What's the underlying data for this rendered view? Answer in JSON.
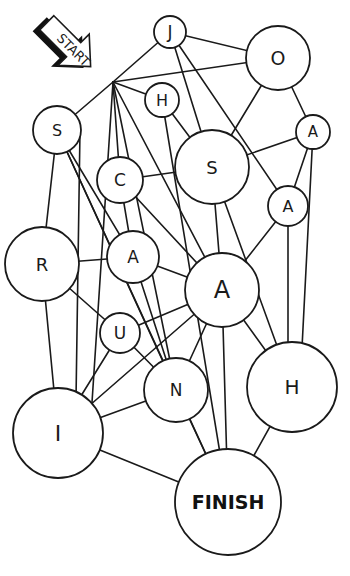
{
  "diagram": {
    "type": "letter-maze-graph",
    "start": {
      "label": "START",
      "hub": [
        113,
        82
      ]
    },
    "finish": {
      "id": "finish",
      "label": "FINISH",
      "cx": 228,
      "cy": 502,
      "r": 53
    },
    "nodes": [
      {
        "id": "j",
        "label": "J",
        "cx": 170,
        "cy": 32,
        "r": 16,
        "font": 17
      },
      {
        "id": "o",
        "label": "O",
        "cx": 278,
        "cy": 58,
        "r": 32,
        "font": 19
      },
      {
        "id": "h1",
        "label": "H",
        "cx": 162,
        "cy": 100,
        "r": 17,
        "font": 16
      },
      {
        "id": "s1",
        "label": "S",
        "cx": 57,
        "cy": 130,
        "r": 24,
        "font": 16
      },
      {
        "id": "a1",
        "label": "A",
        "cx": 313,
        "cy": 132,
        "r": 17,
        "font": 15
      },
      {
        "id": "c",
        "label": "C",
        "cx": 120,
        "cy": 180,
        "r": 23,
        "font": 17
      },
      {
        "id": "s2",
        "label": "S",
        "cx": 212,
        "cy": 167,
        "r": 37,
        "font": 18
      },
      {
        "id": "a2",
        "label": "A",
        "cx": 288,
        "cy": 206,
        "r": 20,
        "font": 16
      },
      {
        "id": "r",
        "label": "R",
        "cx": 42,
        "cy": 264,
        "r": 37,
        "font": 18
      },
      {
        "id": "a3",
        "label": "A",
        "cx": 133,
        "cy": 257,
        "r": 26,
        "font": 17
      },
      {
        "id": "a4",
        "label": "A",
        "cx": 222,
        "cy": 290,
        "r": 37,
        "font": 24
      },
      {
        "id": "u",
        "label": "U",
        "cx": 120,
        "cy": 333,
        "r": 20,
        "font": 17
      },
      {
        "id": "n",
        "label": "N",
        "cx": 176,
        "cy": 390,
        "r": 32,
        "font": 17
      },
      {
        "id": "h2",
        "label": "H",
        "cx": 292,
        "cy": 387,
        "r": 45,
        "font": 20
      },
      {
        "id": "i",
        "label": "I",
        "cx": 58,
        "cy": 433,
        "r": 45,
        "font": 22
      }
    ],
    "edges": [
      [
        113,
        82,
        170,
        32
      ],
      [
        113,
        82,
        278,
        58
      ],
      [
        113,
        82,
        162,
        100
      ],
      [
        113,
        82,
        57,
        130
      ],
      [
        113,
        82,
        120,
        180
      ],
      [
        113,
        82,
        222,
        290
      ],
      [
        113,
        82,
        176,
        390
      ],
      [
        113,
        82,
        90,
        433
      ],
      [
        170,
        32,
        278,
        58
      ],
      [
        170,
        32,
        212,
        167
      ],
      [
        170,
        32,
        288,
        206
      ],
      [
        278,
        58,
        212,
        167
      ],
      [
        278,
        58,
        313,
        132
      ],
      [
        162,
        100,
        212,
        167
      ],
      [
        162,
        100,
        228,
        502
      ],
      [
        57,
        130,
        42,
        264
      ],
      [
        57,
        130,
        133,
        257
      ],
      [
        57,
        130,
        176,
        390
      ],
      [
        313,
        132,
        212,
        167
      ],
      [
        313,
        132,
        288,
        206
      ],
      [
        313,
        132,
        300,
        387
      ],
      [
        120,
        180,
        212,
        167
      ],
      [
        120,
        180,
        133,
        257
      ],
      [
        120,
        180,
        222,
        290
      ],
      [
        212,
        167,
        222,
        290
      ],
      [
        212,
        167,
        292,
        387
      ],
      [
        288,
        206,
        222,
        290
      ],
      [
        288,
        206,
        288,
        387
      ],
      [
        42,
        264,
        133,
        257
      ],
      [
        42,
        264,
        120,
        333
      ],
      [
        42,
        264,
        58,
        433
      ],
      [
        133,
        257,
        222,
        290
      ],
      [
        133,
        257,
        176,
        390
      ],
      [
        222,
        290,
        120,
        333
      ],
      [
        222,
        290,
        58,
        433
      ],
      [
        222,
        290,
        176,
        390
      ],
      [
        222,
        290,
        228,
        502
      ],
      [
        222,
        290,
        292,
        387
      ],
      [
        120,
        333,
        58,
        433
      ],
      [
        120,
        333,
        176,
        390
      ],
      [
        176,
        390,
        58,
        433
      ],
      [
        176,
        390,
        228,
        502
      ],
      [
        58,
        433,
        228,
        502
      ],
      [
        57,
        130,
        228,
        502
      ],
      [
        292,
        387,
        228,
        502
      ],
      [
        80,
        130,
        76,
        400
      ]
    ]
  }
}
